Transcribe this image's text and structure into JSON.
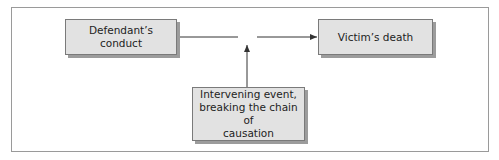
{
  "diagram": {
    "nodes": [
      {
        "id": "defendant",
        "label": "Defendant’s\nconduct"
      },
      {
        "id": "death",
        "label": "Victim’s death"
      },
      {
        "id": "intervening",
        "label": "Intervening event,\nbreaking the chain of\ncausation"
      }
    ],
    "edges": [
      {
        "from": "defendant",
        "to": "death",
        "style": "broken line with gap"
      },
      {
        "from": "intervening",
        "to": "gap",
        "style": "arrow up into gap"
      }
    ]
  }
}
